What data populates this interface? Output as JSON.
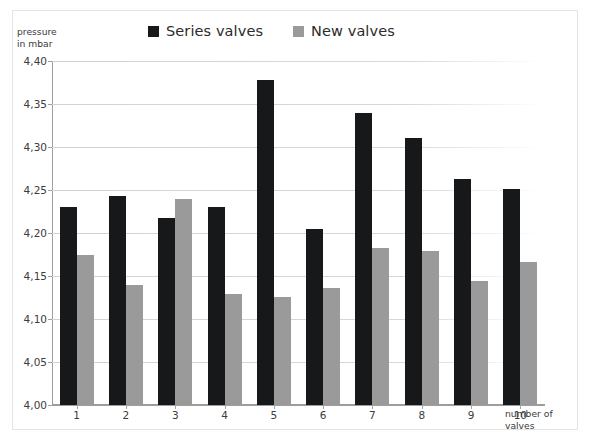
{
  "chart_data": {
    "type": "bar",
    "title": "",
    "xlabel": "number of valves",
    "ylabel": "pressure in mbar",
    "ylabel_line1": "pressure",
    "ylabel_line2": "in mbar",
    "xlabel_line1": "number of",
    "xlabel_line2": "valves",
    "categories": [
      "1",
      "2",
      "3",
      "4",
      "5",
      "6",
      "7",
      "8",
      "9",
      "10"
    ],
    "ylim": [
      4.0,
      4.4
    ],
    "ytick_step": 0.05,
    "ytick_labels": [
      "4,40",
      "4,35",
      "4,30",
      "4,25",
      "4,20",
      "4,15",
      "4,10",
      "4,05",
      "4,00"
    ],
    "ytick_values": [
      4.4,
      4.35,
      4.3,
      4.25,
      4.2,
      4.15,
      4.1,
      4.05,
      4.0
    ],
    "decimal_separator": ",",
    "grid": true,
    "legend_position": "top",
    "series": [
      {
        "name": "Series valves",
        "color": "#17181a",
        "values": [
          4.23,
          4.243,
          4.217,
          4.23,
          4.378,
          4.205,
          4.34,
          4.311,
          4.263,
          4.251
        ]
      },
      {
        "name": "New valves",
        "color": "#9a9a9a",
        "values": [
          4.174,
          4.139,
          4.239,
          4.129,
          4.126,
          4.136,
          4.182,
          4.179,
          4.144,
          4.166
        ]
      }
    ]
  }
}
